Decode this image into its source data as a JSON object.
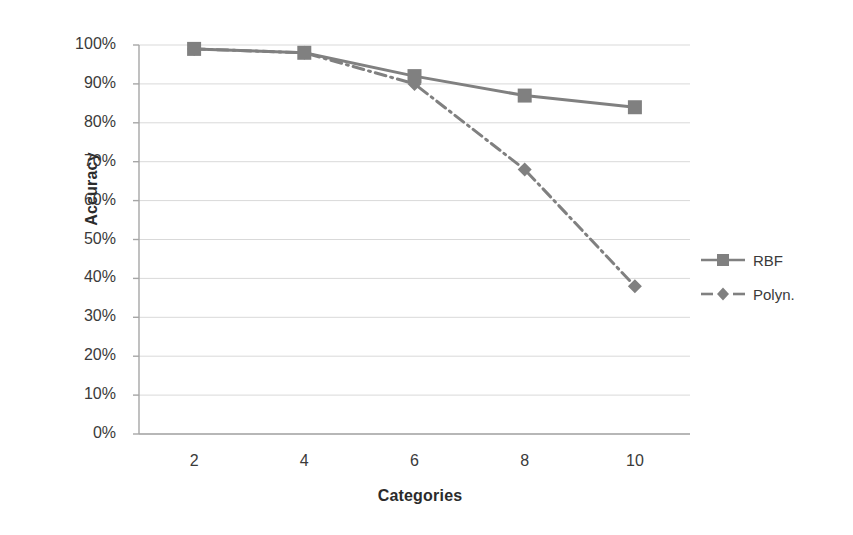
{
  "chart_data": {
    "type": "line",
    "title": "",
    "xlabel": "Categories",
    "ylabel": "Accuracy",
    "x": [
      2,
      4,
      6,
      8,
      10
    ],
    "xtick_labels": [
      "2",
      "4",
      "6",
      "8",
      "10"
    ],
    "xlim": [
      1,
      11
    ],
    "ylim": [
      0,
      100
    ],
    "ytick_labels": [
      "0%",
      "10%",
      "20%",
      "30%",
      "40%",
      "50%",
      "60%",
      "70%",
      "80%",
      "90%",
      "100%"
    ],
    "ytick_values": [
      0,
      10,
      20,
      30,
      40,
      50,
      60,
      70,
      80,
      90,
      100
    ],
    "grid": "horizontal",
    "legend_position": "right",
    "series": [
      {
        "name": "RBF",
        "values": [
          99,
          98,
          92,
          87,
          84
        ],
        "marker": "square",
        "linestyle": "solid",
        "color": "#808080"
      },
      {
        "name": "Polyn.",
        "values": [
          99,
          98,
          90,
          68,
          38
        ],
        "marker": "diamond",
        "linestyle": "dashdot",
        "color": "#808080"
      }
    ]
  },
  "axes": {
    "y_title": "Accuracy",
    "x_title": "Categories"
  },
  "legend": {
    "entries": [
      {
        "label": "RBF"
      },
      {
        "label": "Polyn."
      }
    ]
  },
  "colors": {
    "series": "#808080",
    "gridline": "#d9d9d9",
    "axis": "#a6a6a6",
    "text": "#3a3a3a",
    "background": "#ffffff"
  }
}
